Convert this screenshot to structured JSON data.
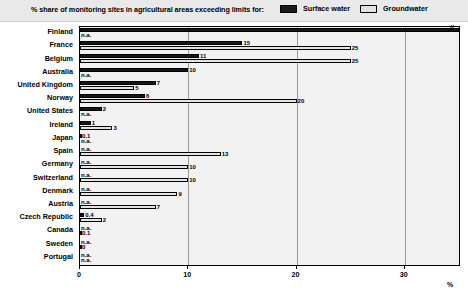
{
  "header": {
    "title": "% share of monitoring sites in agricultural areas exceeding limits for:",
    "legend": [
      {
        "label": "Surface water",
        "swatch": "dark",
        "color": "#161616"
      },
      {
        "label": "Groundwater",
        "swatch": "light",
        "color": "#e4e4e4"
      }
    ]
  },
  "axis": {
    "ticks": [
      "0",
      "10",
      "20",
      "30"
    ],
    "tick_values": [
      0,
      10,
      20,
      30
    ],
    "xmin": 0,
    "xmax": 35,
    "unit": "%"
  },
  "chart_data": {
    "type": "bar",
    "orientation": "horizontal",
    "title": "% share of monitoring sites in agricultural areas exceeding limits for:",
    "xlabel": "%",
    "ylabel": "",
    "xlim": [
      0,
      35
    ],
    "grid": true,
    "legend_position": "top-right",
    "categories": [
      "Finland",
      "France",
      "Belgium",
      "Australia",
      "United Kingdom",
      "Norway",
      "United States",
      "Ireland",
      "Japan",
      "Spain",
      "Germany",
      "Switzerland",
      "Denmark",
      "Austria",
      "Czech Republic",
      "Canada",
      "Sweden",
      "Portugal"
    ],
    "series": [
      {
        "name": "Surface water",
        "color": "#161616",
        "values": [
          75,
          15,
          11,
          10,
          7,
          6,
          2,
          1,
          0.1,
          null,
          null,
          null,
          null,
          null,
          0.4,
          null,
          null,
          null
        ],
        "labels": [
          "75",
          "15",
          "11",
          "10",
          "7",
          "6",
          "2",
          "1",
          "0.1",
          "n.a.",
          "n.a.",
          "n.a.",
          "n.a.",
          "n.a.",
          "0.4",
          "n.a.",
          "n.a.",
          "n.a."
        ]
      },
      {
        "name": "Groundwater",
        "color": "#e4e4e4",
        "values": [
          null,
          25,
          25,
          null,
          5,
          20,
          null,
          3,
          null,
          13,
          10,
          10,
          9,
          7,
          2,
          0.1,
          0,
          null
        ],
        "labels": [
          "n.a.",
          "25",
          "25",
          "n.a.",
          "5",
          "20",
          "n.a.",
          "3",
          "n.a.",
          "13",
          "10",
          "10",
          "9",
          "7",
          "2",
          "0.1",
          "0",
          "n.a."
        ]
      }
    ],
    "notes": [
      "Finland surface water value of 75 exceeds the plotted axis range; bar is truncated with a scale-break marker."
    ]
  }
}
